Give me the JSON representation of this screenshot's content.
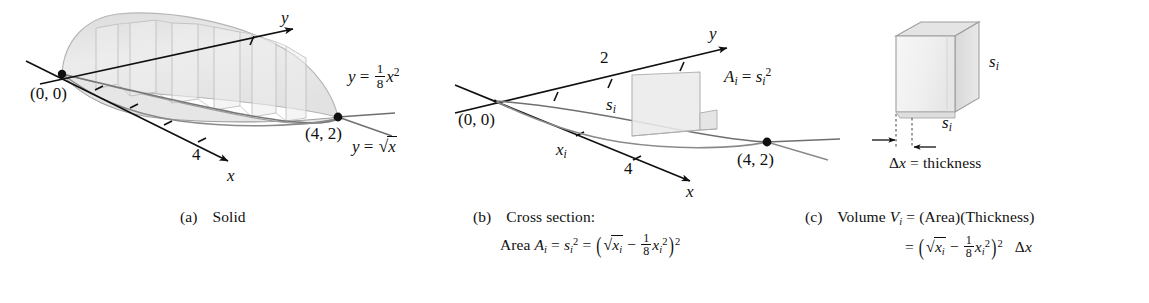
{
  "figure": {
    "title_alt": "Volume by cross sections of a solid between y = sqrt(x) and y = (1/8)x^2",
    "colors": {
      "ink": "#101010",
      "curve_gray": "#6e6e6e",
      "solid_fill": "#e9e9e9",
      "solid_edge": "#b9b9b9",
      "box_fill": "#efefef",
      "box_edge": "#9a9a9a",
      "background": "#ffffff"
    }
  },
  "panel_a": {
    "caption_tag": "(a)",
    "caption_text": "Solid",
    "origin_label": "(0, 0)",
    "point_label": "(4, 2)",
    "axis_x_label": "x",
    "axis_y_label": "y",
    "tick_x_label": "4",
    "curve_upper": {
      "lhs": "y",
      "eq": "=",
      "rhs_root": "x"
    },
    "curve_lower": {
      "lhs": "y",
      "eq": "=",
      "num": "1",
      "den": "8",
      "var": "x",
      "exp": "2"
    }
  },
  "panel_b": {
    "caption_tag": "(b)",
    "caption_text": "Cross section:",
    "caption_line2_prefix": "Area",
    "area_symbol": "A",
    "area_sub": "i",
    "s_symbol": "s",
    "s_sub": "i",
    "s_exp": "2",
    "origin_label": "(0, 0)",
    "point_label": "(4, 2)",
    "axis_x_label": "x",
    "axis_y_label": "y",
    "tick_x_label": "4",
    "tick_y_label": "2",
    "x_i_label": {
      "var": "x",
      "sub": "i"
    },
    "s_i_label": {
      "var": "s",
      "sub": "i"
    },
    "area_annotation": "A_i = s_i^2",
    "formula": {
      "num": "1",
      "den": "8",
      "var": "x",
      "exp": "2",
      "outer_exp": "2"
    }
  },
  "panel_c": {
    "caption_tag": "(c)",
    "caption_text": "Volume",
    "volume_symbol": "V",
    "volume_sub": "i",
    "caption_rhs": "(Area)(Thickness)",
    "side_label_right": {
      "var": "s",
      "sub": "i"
    },
    "side_label_bottom": {
      "var": "s",
      "sub": "i"
    },
    "thickness_label": {
      "delta": "Δ",
      "var": "x",
      "eq": "=",
      "word": "thickness"
    },
    "formula": {
      "num": "1",
      "den": "8",
      "var": "x",
      "exp": "2",
      "outer_exp": "2",
      "dx_delta": "Δ",
      "dx_var": "x"
    }
  }
}
